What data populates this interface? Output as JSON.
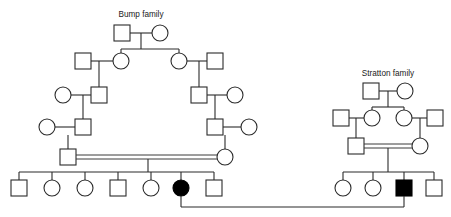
{
  "figure": {
    "type": "pedigree-chart",
    "background_color": "#ffffff",
    "line_color": "#2b2b2b",
    "affected_fill": "#000000",
    "unaffected_fill": "#ffffff",
    "width": 451,
    "height": 217
  },
  "labels": {
    "bump_family": "Bump family",
    "stratton_family": "Stratton family"
  },
  "legend_semantics": {
    "square": "male",
    "circle": "female",
    "filled": "affected",
    "open": "unaffected",
    "double_line": "consanguineous mating"
  },
  "bump_family": {
    "title": "Bump family",
    "generations": [
      {
        "id": "B-I",
        "members": [
          {
            "name": "B-I-1",
            "shape": "square",
            "affected": false,
            "x": 122,
            "y": 33
          },
          {
            "name": "B-I-2",
            "shape": "circle",
            "affected": false,
            "x": 160,
            "y": 33
          }
        ]
      },
      {
        "id": "B-II",
        "members": [
          {
            "name": "B-II-1",
            "shape": "square",
            "affected": false,
            "x": 83,
            "y": 61
          },
          {
            "name": "B-II-2",
            "shape": "circle",
            "affected": false,
            "x": 121,
            "y": 61
          },
          {
            "name": "B-II-3",
            "shape": "circle",
            "affected": false,
            "x": 179,
            "y": 61
          },
          {
            "name": "B-II-4",
            "shape": "square",
            "affected": false,
            "x": 215,
            "y": 61
          }
        ]
      },
      {
        "id": "B-III",
        "members": [
          {
            "name": "B-III-1",
            "shape": "circle",
            "affected": false,
            "x": 63,
            "y": 95
          },
          {
            "name": "B-III-2",
            "shape": "square",
            "affected": false,
            "x": 99,
            "y": 95
          },
          {
            "name": "B-III-3",
            "shape": "square",
            "affected": false,
            "x": 199,
            "y": 95
          },
          {
            "name": "B-III-4",
            "shape": "circle",
            "affected": false,
            "x": 235,
            "y": 95
          }
        ]
      },
      {
        "id": "B-IV",
        "members": [
          {
            "name": "B-IV-1",
            "shape": "circle",
            "affected": false,
            "x": 47,
            "y": 127
          },
          {
            "name": "B-IV-2",
            "shape": "square",
            "affected": false,
            "x": 83,
            "y": 127
          },
          {
            "name": "B-IV-3",
            "shape": "square",
            "affected": false,
            "x": 215,
            "y": 127
          },
          {
            "name": "B-IV-4",
            "shape": "circle",
            "affected": false,
            "x": 249,
            "y": 127
          }
        ]
      },
      {
        "id": "B-V",
        "members": [
          {
            "name": "B-V-father",
            "shape": "square",
            "affected": false,
            "x": 68,
            "y": 157
          },
          {
            "name": "B-V-mother",
            "shape": "circle",
            "affected": false,
            "x": 225,
            "y": 157
          }
        ]
      },
      {
        "id": "B-VI",
        "members": [
          {
            "name": "B-VI-1",
            "shape": "square",
            "affected": false,
            "x": 19,
            "y": 188
          },
          {
            "name": "B-VI-2",
            "shape": "circle",
            "affected": false,
            "x": 52,
            "y": 188
          },
          {
            "name": "B-VI-3",
            "shape": "circle",
            "affected": false,
            "x": 85,
            "y": 188
          },
          {
            "name": "B-VI-4",
            "shape": "square",
            "affected": false,
            "x": 118,
            "y": 188
          },
          {
            "name": "B-VI-5",
            "shape": "circle",
            "affected": false,
            "x": 151,
            "y": 188
          },
          {
            "name": "B-VI-6",
            "shape": "circle",
            "affected": true,
            "x": 181,
            "y": 188
          },
          {
            "name": "B-VI-7",
            "shape": "square",
            "affected": false,
            "x": 214,
            "y": 188
          }
        ]
      }
    ],
    "consanguineous_couple": [
      "B-V-father",
      "B-V-mother"
    ],
    "affected_count": 1,
    "sibship_size": 7
  },
  "stratton_family": {
    "title": "Stratton family",
    "generations": [
      {
        "id": "S-I",
        "members": [
          {
            "name": "S-I-1",
            "shape": "square",
            "affected": false,
            "x": 371,
            "y": 91
          },
          {
            "name": "S-I-2",
            "shape": "circle",
            "affected": false,
            "x": 405,
            "y": 91
          }
        ]
      },
      {
        "id": "S-II",
        "members": [
          {
            "name": "S-II-1",
            "shape": "square",
            "affected": false,
            "x": 341,
            "y": 118
          },
          {
            "name": "S-II-2",
            "shape": "circle",
            "affected": false,
            "x": 372,
            "y": 118
          },
          {
            "name": "S-II-3",
            "shape": "circle",
            "affected": false,
            "x": 404,
            "y": 118
          },
          {
            "name": "S-II-4",
            "shape": "square",
            "affected": false,
            "x": 435,
            "y": 118
          }
        ]
      },
      {
        "id": "S-III",
        "members": [
          {
            "name": "S-III-father",
            "shape": "square",
            "affected": false,
            "x": 356,
            "y": 146
          },
          {
            "name": "S-III-mother",
            "shape": "circle",
            "affected": false,
            "x": 420,
            "y": 146
          }
        ]
      },
      {
        "id": "S-IV",
        "members": [
          {
            "name": "S-IV-1",
            "shape": "circle",
            "affected": false,
            "x": 343,
            "y": 188
          },
          {
            "name": "S-IV-2",
            "shape": "circle",
            "affected": false,
            "x": 373,
            "y": 188
          },
          {
            "name": "S-IV-3",
            "shape": "square",
            "affected": true,
            "x": 404,
            "y": 188
          },
          {
            "name": "S-IV-4",
            "shape": "square",
            "affected": false,
            "x": 434,
            "y": 188
          }
        ]
      }
    ],
    "consanguineous_couple": [
      "S-III-father",
      "S-III-mother"
    ],
    "affected_count": 1,
    "sibship_size": 4
  },
  "cross_family_union": {
    "partner_left": "B-VI-6",
    "partner_right": "S-IV-3",
    "description": "Mating line connecting the affected female of the Bump family to the affected male of the Stratton family",
    "drop_y": 207
  }
}
